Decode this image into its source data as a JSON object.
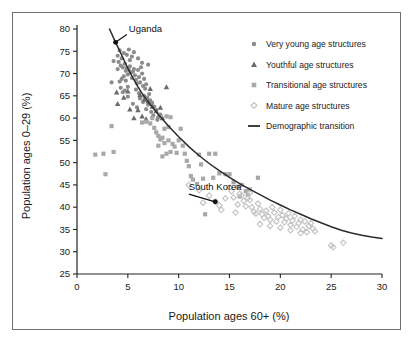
{
  "figure": {
    "border_color": "#6e6e6e",
    "background": "#ffffff"
  },
  "chart_data": {
    "type": "scatter",
    "title": "",
    "xlabel": "Population ages 60+ (%)",
    "ylabel": "Population ages 0–29 (%)",
    "xlim": [
      0,
      30
    ],
    "ylim": [
      25,
      80
    ],
    "xticks": [
      0,
      5,
      10,
      15,
      20,
      25,
      30
    ],
    "yticks": [
      25,
      30,
      35,
      40,
      45,
      50,
      55,
      60,
      65,
      70,
      75,
      80
    ],
    "xtick_labels": [
      "0",
      "5",
      "10",
      "15",
      "20",
      "25",
      "30"
    ],
    "ytick_labels": [
      "25",
      "30",
      "35",
      "40",
      "45",
      "50",
      "55",
      "60",
      "65",
      "70",
      "75",
      "80"
    ],
    "grid": false,
    "legend_position": "upper right",
    "legend": [
      {
        "label": "Very young age structures",
        "marker": "circle",
        "color": "#8c8c8c"
      },
      {
        "label": "Youthful age structures",
        "marker": "triangle",
        "color": "#6b6b6b"
      },
      {
        "label": "Transitional age structures",
        "marker": "square",
        "color": "#a8a8a8"
      },
      {
        "label": "Mature age structures",
        "marker": "diamond",
        "color": "#c2c2c2"
      },
      {
        "label": "Demographic transition",
        "marker": "line",
        "color": "#2b2b2b"
      }
    ],
    "annotations": [
      {
        "text": "Uganda",
        "x": 3.8,
        "y": 77.0,
        "label_x": 4.9,
        "label_y": 79.0
      },
      {
        "text": "South Korea",
        "x": 13.6,
        "y": 41.2,
        "label_x": 11.0,
        "label_y": 43.6
      }
    ],
    "series": [
      {
        "name": "Very young age structures",
        "marker": "circle",
        "color": "#8c8c8c",
        "points": [
          [
            3.8,
            77.0
          ],
          [
            4.2,
            75.2
          ],
          [
            4.6,
            74.6
          ],
          [
            4.4,
            73.4
          ],
          [
            4.1,
            72.6
          ],
          [
            4.3,
            71.8
          ],
          [
            4.0,
            71.0
          ],
          [
            4.5,
            71.4
          ],
          [
            4.7,
            72.2
          ],
          [
            4.8,
            70.6
          ],
          [
            4.9,
            71.2
          ],
          [
            5.1,
            70.8
          ],
          [
            5.0,
            69.8
          ],
          [
            4.6,
            69.4
          ],
          [
            4.4,
            68.8
          ],
          [
            4.2,
            68.2
          ],
          [
            4.8,
            68.4
          ],
          [
            5.2,
            71.6
          ],
          [
            5.3,
            70.2
          ],
          [
            5.4,
            69.0
          ],
          [
            5.5,
            70.4
          ],
          [
            5.6,
            71.0
          ],
          [
            5.7,
            69.6
          ],
          [
            5.8,
            68.6
          ],
          [
            5.9,
            67.8
          ],
          [
            6.0,
            70.8
          ],
          [
            6.1,
            69.2
          ],
          [
            6.2,
            68.0
          ],
          [
            6.3,
            71.4
          ],
          [
            6.4,
            70.0
          ],
          [
            6.5,
            67.2
          ],
          [
            6.6,
            68.8
          ],
          [
            6.7,
            66.6
          ],
          [
            6.8,
            67.6
          ],
          [
            7.0,
            72.0
          ],
          [
            3.4,
            68.0
          ],
          [
            3.6,
            72.8
          ],
          [
            4.0,
            74.0
          ],
          [
            4.9,
            74.2
          ],
          [
            5.1,
            75.4
          ],
          [
            5.4,
            73.8
          ],
          [
            5.6,
            74.8
          ],
          [
            5.2,
            73.0
          ],
          [
            6.0,
            73.4
          ],
          [
            6.4,
            72.4
          ],
          [
            4.3,
            66.8
          ],
          [
            4.5,
            65.8
          ],
          [
            5.0,
            67.0
          ],
          [
            5.8,
            66.4
          ],
          [
            6.1,
            65.6
          ],
          [
            6.6,
            65.0
          ],
          [
            7.1,
            65.4
          ],
          [
            7.2,
            64.0
          ],
          [
            7.4,
            63.4
          ],
          [
            7.6,
            62.6
          ],
          [
            7.8,
            61.8
          ],
          [
            6.9,
            64.6
          ],
          [
            7.0,
            63.0
          ],
          [
            7.3,
            61.4
          ],
          [
            7.5,
            60.6
          ],
          [
            8.0,
            60.2
          ],
          [
            8.2,
            60.8
          ],
          [
            6.8,
            62.0
          ],
          [
            6.5,
            63.6
          ],
          [
            6.2,
            64.4
          ],
          [
            5.9,
            62.4
          ],
          [
            5.5,
            63.2
          ],
          [
            5.0,
            64.8
          ],
          [
            4.7,
            66.2
          ],
          [
            7.9,
            59.6
          ]
        ]
      },
      {
        "name": "Youthful age structures",
        "marker": "triangle",
        "color": "#6b6b6b",
        "points": [
          [
            3.9,
            65.8
          ],
          [
            4.0,
            63.2
          ],
          [
            4.6,
            64.6
          ],
          [
            5.0,
            66.0
          ],
          [
            6.2,
            65.2
          ],
          [
            6.6,
            64.2
          ],
          [
            7.0,
            63.8
          ],
          [
            7.4,
            62.6
          ],
          [
            7.8,
            61.6
          ],
          [
            8.2,
            62.4
          ],
          [
            8.8,
            67.0
          ],
          [
            6.0,
            61.8
          ],
          [
            6.4,
            60.4
          ],
          [
            5.6,
            60.0
          ],
          [
            7.2,
            66.6
          ],
          [
            8.4,
            60.0
          ],
          [
            5.2,
            62.0
          ],
          [
            6.8,
            59.8
          ]
        ]
      },
      {
        "name": "Transitional age structures",
        "marker": "square",
        "color": "#a8a8a8",
        "points": [
          [
            1.8,
            51.8
          ],
          [
            2.6,
            52.0
          ],
          [
            2.8,
            47.4
          ],
          [
            3.6,
            52.4
          ],
          [
            3.4,
            58.2
          ],
          [
            6.4,
            59.0
          ],
          [
            6.8,
            59.2
          ],
          [
            7.2,
            58.8
          ],
          [
            7.6,
            57.8
          ],
          [
            7.8,
            56.8
          ],
          [
            8.0,
            56.0
          ],
          [
            8.2,
            55.2
          ],
          [
            8.4,
            55.6
          ],
          [
            8.6,
            54.4
          ],
          [
            8.0,
            53.8
          ],
          [
            8.8,
            60.4
          ],
          [
            9.2,
            60.2
          ],
          [
            8.6,
            57.6
          ],
          [
            9.0,
            55.0
          ],
          [
            9.4,
            54.2
          ],
          [
            9.6,
            53.6
          ],
          [
            9.2,
            52.4
          ],
          [
            8.8,
            52.0
          ],
          [
            8.4,
            51.4
          ],
          [
            9.8,
            52.2
          ],
          [
            10.0,
            55.0
          ],
          [
            10.2,
            57.6
          ],
          [
            10.4,
            53.8
          ],
          [
            10.6,
            52.0
          ],
          [
            11.0,
            49.2
          ],
          [
            11.4,
            46.2
          ],
          [
            11.8,
            45.2
          ],
          [
            12.0,
            51.8
          ],
          [
            12.4,
            46.4
          ],
          [
            12.6,
            38.4
          ],
          [
            13.0,
            52.0
          ],
          [
            13.6,
            52.0
          ],
          [
            14.0,
            47.6
          ],
          [
            14.6,
            47.4
          ],
          [
            15.0,
            47.4
          ],
          [
            15.4,
            45.6
          ],
          [
            15.8,
            44.6
          ],
          [
            16.2,
            45.0
          ],
          [
            16.6,
            43.6
          ],
          [
            17.0,
            44.0
          ],
          [
            17.8,
            46.6
          ],
          [
            9.0,
            58.0
          ],
          [
            7.4,
            60.0
          ],
          [
            10.8,
            50.4
          ],
          [
            11.2,
            47.0
          ],
          [
            12.2,
            49.6
          ],
          [
            13.4,
            46.6
          ],
          [
            16.0,
            42.4
          ],
          [
            16.8,
            42.8
          ]
        ]
      },
      {
        "name": "Mature age structures",
        "marker": "diamond",
        "color": "#c2c2c2",
        "points": [
          [
            11.0,
            45.0
          ],
          [
            12.4,
            41.0
          ],
          [
            13.6,
            41.2
          ],
          [
            14.0,
            40.4
          ],
          [
            14.6,
            42.0
          ],
          [
            15.0,
            44.4
          ],
          [
            15.2,
            43.6
          ],
          [
            15.4,
            42.2
          ],
          [
            15.8,
            40.6
          ],
          [
            16.0,
            43.0
          ],
          [
            16.2,
            42.6
          ],
          [
            16.4,
            41.4
          ],
          [
            16.6,
            40.2
          ],
          [
            16.8,
            42.0
          ],
          [
            17.0,
            41.6
          ],
          [
            17.2,
            40.0
          ],
          [
            17.4,
            39.0
          ],
          [
            17.6,
            38.6
          ],
          [
            17.8,
            40.8
          ],
          [
            18.0,
            39.6
          ],
          [
            18.2,
            38.4
          ],
          [
            18.4,
            37.6
          ],
          [
            18.6,
            39.2
          ],
          [
            18.8,
            38.0
          ],
          [
            19.0,
            37.2
          ],
          [
            19.2,
            40.0
          ],
          [
            19.4,
            38.8
          ],
          [
            19.6,
            36.8
          ],
          [
            19.8,
            37.8
          ],
          [
            20.0,
            39.4
          ],
          [
            20.2,
            38.2
          ],
          [
            20.4,
            36.6
          ],
          [
            20.6,
            37.4
          ],
          [
            20.8,
            38.6
          ],
          [
            21.0,
            36.0
          ],
          [
            21.2,
            37.0
          ],
          [
            21.4,
            38.0
          ],
          [
            21.6,
            35.6
          ],
          [
            21.8,
            36.4
          ],
          [
            22.0,
            37.2
          ],
          [
            22.2,
            35.0
          ],
          [
            22.4,
            36.8
          ],
          [
            22.6,
            34.4
          ],
          [
            22.8,
            35.8
          ],
          [
            23.0,
            36.4
          ],
          [
            23.2,
            35.2
          ],
          [
            23.4,
            34.6
          ],
          [
            25.0,
            31.4
          ],
          [
            25.2,
            31.0
          ],
          [
            26.2,
            32.0
          ],
          [
            14.2,
            39.4
          ],
          [
            15.6,
            38.8
          ],
          [
            13.0,
            42.6
          ],
          [
            17.0,
            43.2
          ],
          [
            19.0,
            35.8
          ],
          [
            20.0,
            35.4
          ],
          [
            21.0,
            34.8
          ],
          [
            12.0,
            43.8
          ],
          [
            18.0,
            36.2
          ],
          [
            22.0,
            34.2
          ]
        ]
      }
    ],
    "curve": {
      "name": "Demographic transition",
      "color": "#2b2b2b",
      "points": [
        [
          3.2,
          80.0
        ],
        [
          3.8,
          77.0
        ],
        [
          4.5,
          73.6
        ],
        [
          5.0,
          71.2
        ],
        [
          5.5,
          69.0
        ],
        [
          6.0,
          67.0
        ],
        [
          6.5,
          65.2
        ],
        [
          7.0,
          63.6
        ],
        [
          7.5,
          62.2
        ],
        [
          8.0,
          60.8
        ],
        [
          8.5,
          59.5
        ],
        [
          9.0,
          58.2
        ],
        [
          9.5,
          57.0
        ],
        [
          10.0,
          55.8
        ],
        [
          11.0,
          53.6
        ],
        [
          12.0,
          51.6
        ],
        [
          13.0,
          49.8
        ],
        [
          14.0,
          48.2
        ],
        [
          15.0,
          46.7
        ],
        [
          16.0,
          45.3
        ],
        [
          17.0,
          44.0
        ],
        [
          18.0,
          42.8
        ],
        [
          19.0,
          41.6
        ],
        [
          20.0,
          40.5
        ],
        [
          21.0,
          39.4
        ],
        [
          22.0,
          38.4
        ],
        [
          23.0,
          37.4
        ],
        [
          24.0,
          36.5
        ],
        [
          25.0,
          35.6
        ],
        [
          26.0,
          34.8
        ],
        [
          27.0,
          34.2
        ],
        [
          28.0,
          33.7
        ],
        [
          29.0,
          33.3
        ],
        [
          30.0,
          33.0
        ]
      ]
    }
  }
}
